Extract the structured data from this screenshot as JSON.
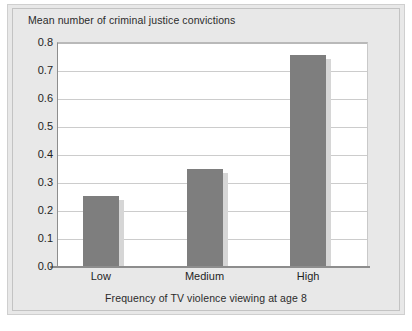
{
  "chart_data": {
    "type": "bar",
    "title": "Mean number of criminal justice convictions",
    "xlabel": "Frequency of TV violence viewing at age 8",
    "ylabel": "Mean number of criminal justice convictions",
    "categories": [
      "Low",
      "Medium",
      "High"
    ],
    "values": [
      0.25,
      0.345,
      0.755
    ],
    "ylim": [
      0.0,
      0.8
    ],
    "ytick_labels": [
      "0.0",
      "0.1",
      "0.2",
      "0.3",
      "0.4",
      "0.5",
      "0.6",
      "0.7",
      "0.8"
    ],
    "ytick_values": [
      0.0,
      0.1,
      0.2,
      0.3,
      0.4,
      0.5,
      0.6,
      0.7,
      0.8
    ],
    "grid": true,
    "legend": false,
    "legend_position": "none",
    "bar_color": "#7e7e7e",
    "background_color": "#e8e8e8",
    "plot_background_color": "#ffffff",
    "gridline_color": "#cccccc",
    "axis_color": "#8d8d8d"
  }
}
